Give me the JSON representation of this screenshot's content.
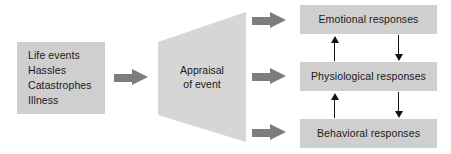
{
  "diagram": {
    "colors": {
      "box_fill": "#cfcfcf",
      "funnel_fill": "#d6d6d6",
      "block_arrow": "#7d7d7d",
      "thin_arrow": "#111111",
      "text": "#1a1a1a",
      "background": "#ffffff"
    },
    "stressor_box": {
      "name": "stressors",
      "items": [
        "Life events",
        "Hassles",
        "Catastrophes",
        "Illness"
      ]
    },
    "appraisal": {
      "line1": "Appraisal",
      "line2": "of event"
    },
    "responses": [
      {
        "id": "emotional",
        "label": "Emotional responses"
      },
      {
        "id": "physiological",
        "label": "Physiological responses"
      },
      {
        "id": "behavioral",
        "label": "Behavioral responses"
      }
    ],
    "arrows": [
      {
        "id": "stressors-to-appraisal",
        "style": "block",
        "direction": "right"
      },
      {
        "id": "appraisal-to-emotional",
        "style": "block",
        "direction": "right"
      },
      {
        "id": "appraisal-to-physiological",
        "style": "block",
        "direction": "right"
      },
      {
        "id": "appraisal-to-behavioral",
        "style": "block",
        "direction": "right"
      },
      {
        "id": "physiological-to-emotional",
        "style": "thin",
        "direction": "up"
      },
      {
        "id": "emotional-to-physiological",
        "style": "thin",
        "direction": "down"
      },
      {
        "id": "behavioral-to-physiological",
        "style": "thin",
        "direction": "up"
      },
      {
        "id": "physiological-to-behavioral",
        "style": "thin",
        "direction": "down"
      }
    ]
  }
}
